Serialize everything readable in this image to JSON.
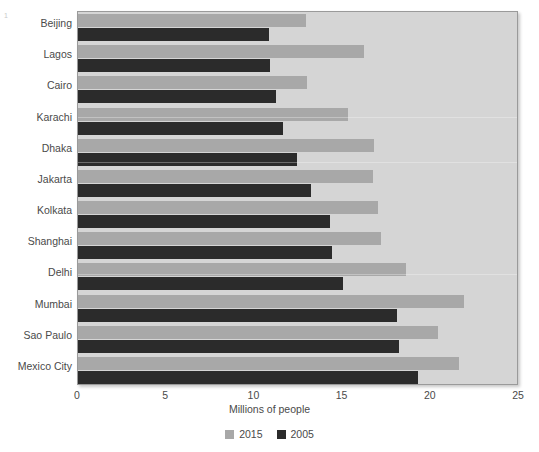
{
  "corner_mark": "1",
  "chart_data": {
    "type": "bar",
    "orientation": "horizontal",
    "title": "",
    "xlabel": "Millions of people",
    "ylabel": "",
    "xlim": [
      0,
      25
    ],
    "xticks": [
      0,
      5,
      10,
      15,
      20,
      25
    ],
    "grid": false,
    "legend_position": "bottom",
    "categories": [
      "Beijing",
      "Lagos",
      "Cairo",
      "Karachi",
      "Dhaka",
      "Jakarta",
      "Kolkata",
      "Shanghai",
      "Delhi",
      "Mumbai",
      "Sao Paulo",
      "Mexico City"
    ],
    "series": [
      {
        "name": "2015",
        "color": "#a8a8a8",
        "values": [
          12.9,
          16.2,
          13.0,
          15.3,
          16.8,
          16.7,
          17.0,
          17.2,
          18.6,
          21.9,
          20.4,
          21.6
        ]
      },
      {
        "name": "2005",
        "color": "#2b2b2b",
        "values": [
          10.8,
          10.9,
          11.2,
          11.6,
          12.4,
          13.2,
          14.3,
          14.4,
          15.0,
          18.1,
          18.2,
          19.3
        ]
      }
    ]
  },
  "colors": {
    "plot_background": "#d5d5d5",
    "plot_border": "#9a9a9a",
    "series_2015": "#a8a8a8",
    "series_2005": "#2b2b2b",
    "text": "#4a4a4a"
  }
}
